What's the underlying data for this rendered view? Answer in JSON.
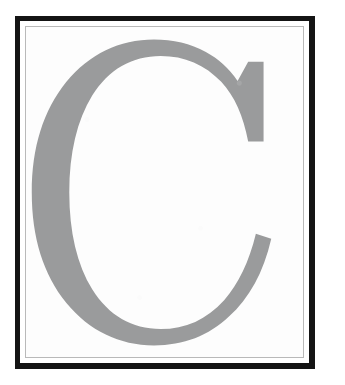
{
  "canvas": {
    "width": 345,
    "height": 385,
    "background_color": "#ffffff",
    "margin_color": "#ffffff"
  },
  "frame": {
    "name": "double-rule-picture-frame",
    "outer_rule": {
      "color": "#141414",
      "thickness_px": 5,
      "left": 15,
      "top": 16,
      "width": 300,
      "height": 353
    },
    "gap": {
      "color": "#ffffff",
      "thickness_px": 5
    },
    "inner_rule": {
      "color": "#b9b9b9",
      "thickness_px": 1
    },
    "plate_color": "#fdfdfd"
  },
  "artwork": {
    "type": "letterform",
    "character": "C",
    "case": "uppercase",
    "style": "serif",
    "fill_color": "#9a9b9c",
    "bounds": {
      "left": 52,
      "top": 60,
      "right": 285,
      "bottom": 322
    },
    "description": "Large gray serif capital C"
  }
}
